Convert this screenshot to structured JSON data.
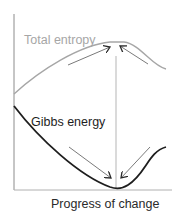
{
  "diagram": {
    "labels": {
      "entropy": "Total entropy",
      "gibbs": "Gibbs energy",
      "xaxis": "Progress of change"
    },
    "colors": {
      "background": "#ffffff",
      "axis": "#8c8c8c",
      "entropy_curve": "#a6a6a6",
      "entropy_label": "#a6a6a6",
      "gibbs_curve": "#1e1e1e",
      "gibbs_label": "#1e1e1e",
      "arrow": "#7a7a7a",
      "arrow_head": "#2a2a2a",
      "equilibrium_line": "#b5b5b5",
      "xaxis_label": "#2a2a2a"
    },
    "curves": {
      "entropy": "M14,94 C40,70 80,45 110,42 L124,42 C140,44 152,66 166,69",
      "gibbs": "M14,106 C40,140 80,176 110,187 C116,189 122,189 128,185 C146,174 148,152 166,147"
    },
    "equilibrium": {
      "x": 116,
      "y_top": 56,
      "y_bottom": 188
    },
    "arrows": [
      {
        "name": "entropy-left-arrow",
        "x1": 68,
        "y1": 65,
        "x2": 110,
        "y2": 47
      },
      {
        "name": "entropy-right-arrow",
        "x1": 148,
        "y1": 64,
        "x2": 120,
        "y2": 46
      },
      {
        "name": "gibbs-left-arrow",
        "x1": 69,
        "y1": 147,
        "x2": 111,
        "y2": 178
      },
      {
        "name": "gibbs-right-arrow",
        "x1": 150,
        "y1": 147,
        "x2": 121,
        "y2": 178
      }
    ]
  }
}
